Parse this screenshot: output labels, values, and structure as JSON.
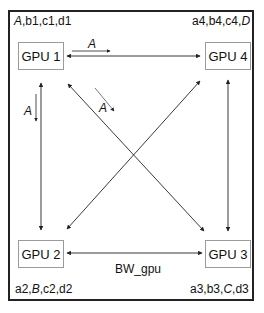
{
  "diagram": {
    "nodes": [
      {
        "id": "gpu1",
        "label": "GPU 1"
      },
      {
        "id": "gpu2",
        "label": "GPU 2"
      },
      {
        "id": "gpu3",
        "label": "GPU 3"
      },
      {
        "id": "gpu4",
        "label": "GPU 4"
      }
    ],
    "corner_labels": {
      "gpu1": {
        "parts": [
          "A",
          ",b1,c1,d1"
        ],
        "italic_index": 0
      },
      "gpu4": {
        "parts": [
          "a4,b4,c4,",
          "D"
        ],
        "italic_index": 1
      },
      "gpu2": {
        "parts": [
          "a2,",
          "B",
          ",c2,d2"
        ],
        "italic_index": 1
      },
      "gpu3": {
        "parts": [
          "a3,b3,",
          "C",
          ",d3"
        ],
        "italic_index": 1
      }
    },
    "edges": [
      {
        "from": "gpu1",
        "to": "gpu4",
        "type": "bidirectional"
      },
      {
        "from": "gpu1",
        "to": "gpu2",
        "type": "bidirectional"
      },
      {
        "from": "gpu1",
        "to": "gpu3",
        "type": "bidirectional"
      },
      {
        "from": "gpu4",
        "to": "gpu2",
        "type": "bidirectional"
      },
      {
        "from": "gpu4",
        "to": "gpu3",
        "type": "bidirectional"
      },
      {
        "from": "gpu2",
        "to": "gpu3",
        "type": "bidirectional"
      }
    ],
    "transfer_labels": [
      {
        "text": "A",
        "direction": "gpu1 -> gpu4"
      },
      {
        "text": "A",
        "direction": "gpu1 -> gpu2"
      },
      {
        "text": "A",
        "direction": "gpu1 -> gpu3"
      }
    ],
    "bandwidth_label": "BW_gpu",
    "colors": {
      "line": "#222222",
      "box_border": "#9a9a9a",
      "frame": "#222222"
    }
  }
}
